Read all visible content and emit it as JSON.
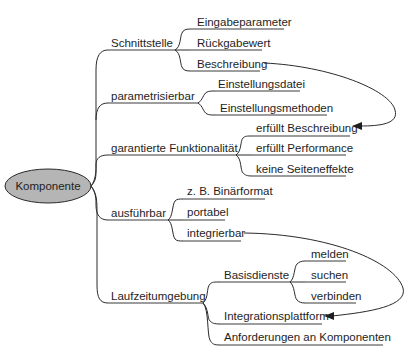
{
  "root": {
    "label": "Komponente",
    "fill": "#b5b5b5"
  },
  "branches": [
    {
      "label": "Schnittstelle",
      "children": [
        "Eingabeparameter",
        "Rückgabewert",
        "Beschreibung"
      ]
    },
    {
      "label": "parametrisierbar",
      "children": [
        "Einstellungsdatei",
        "Einstellungsmethoden"
      ]
    },
    {
      "label": "garantierte Funktionalität",
      "children": [
        "erfüllt Beschreibung",
        "erfüllt Performance",
        "keine Seiteneffekte"
      ]
    },
    {
      "label": "ausführbar",
      "children": [
        "z. B. Binärformat",
        "portabel",
        "integrierbar"
      ]
    },
    {
      "label": "Laufzeitumgebung",
      "children": [
        {
          "label": "Basisdienste",
          "children": [
            "melden",
            "suchen",
            "verbinden"
          ]
        },
        "Integrationsplattform",
        "Anforderungen an Komponenten"
      ]
    }
  ],
  "cross_links": [
    {
      "from": "Beschreibung",
      "to": "erfüllt Beschreibung"
    },
    {
      "from": "integrierbar",
      "to": "Integrationsplattform"
    }
  ],
  "labels": {
    "root": "Komponente",
    "b0": "Schnittstelle",
    "b0c0": "Eingabeparameter",
    "b0c1": "Rückgabewert",
    "b0c2": "Beschreibung",
    "b1": "parametrisierbar",
    "b1c0": "Einstellungsdatei",
    "b1c1": "Einstellungsmethoden",
    "b2": "garantierte Funktionalität",
    "b2c0": "erfüllt Beschreibung",
    "b2c1": "erfüllt Performance",
    "b2c2": "keine Seiteneffekte",
    "b3": "ausführbar",
    "b3c0": "z. B. Binärformat",
    "b3c1": "portabel",
    "b3c2": "integrierbar",
    "b4": "Laufzeitumgebung",
    "b4c0": "Basisdienste",
    "b4c0c0": "melden",
    "b4c0c1": "suchen",
    "b4c0c2": "verbinden",
    "b4c1": "Integrationsplattform",
    "b4c2": "Anforderungen an Komponenten"
  }
}
